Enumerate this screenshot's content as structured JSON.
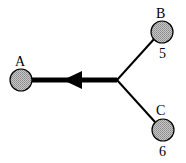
{
  "diagram": {
    "nodes": [
      {
        "id": "A",
        "label": "A",
        "value": ""
      },
      {
        "id": "B",
        "label": "B",
        "value": "5"
      },
      {
        "id": "C",
        "label": "C",
        "value": "6"
      }
    ],
    "edges": [
      {
        "from": "junction",
        "to": "A",
        "style": "thick-arrow"
      },
      {
        "from": "B",
        "to": "junction",
        "style": "thin"
      },
      {
        "from": "C",
        "to": "junction",
        "style": "thin"
      }
    ],
    "colors": {
      "node_fill": "#a8a8a8",
      "line": "#000000"
    }
  }
}
